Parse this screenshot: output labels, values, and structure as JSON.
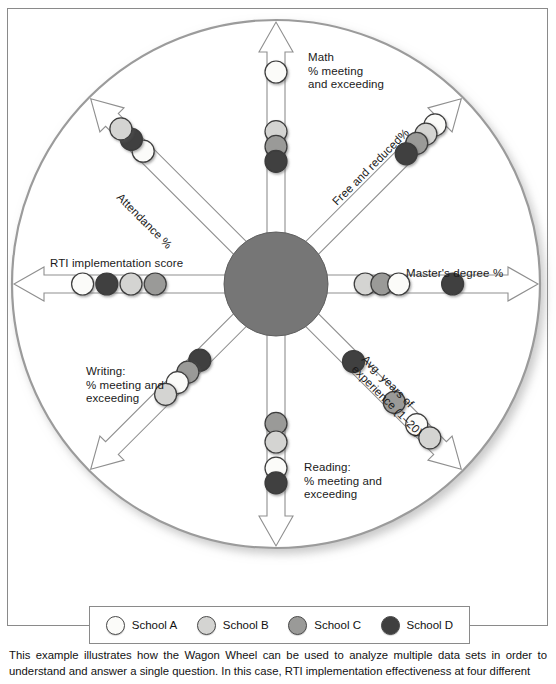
{
  "figure": {
    "name": "Wagon Wheel diagram",
    "caption": "This example illustrates how the Wagon Wheel can be used to analyze multiple data sets in order to understand and answer a single question. In this case, RTI implementation effectiveness at four different"
  },
  "colors": {
    "school_a": "#fbfbf9",
    "school_b": "#d4d4d2",
    "school_c": "#9a9a98",
    "school_d": "#3f3f3f",
    "hub": "#767676",
    "rim": "#9b9b9b",
    "spoke_stroke": "#8f8f8f",
    "frame": "#8a8a8a",
    "text": "#1a1a1a"
  },
  "legend": {
    "name": "school-legend",
    "entries": [
      {
        "label": "School A",
        "color": "#fbfbf9"
      },
      {
        "label": "School B",
        "color": "#d4d4d2"
      },
      {
        "label": "School C",
        "color": "#9a9a98"
      },
      {
        "label": "School D",
        "color": "#3f3f3f"
      }
    ]
  },
  "chart_data": {
    "type": "scatter",
    "title": "Wagon Wheel",
    "subtitle": "",
    "xlabel": "",
    "ylabel": "",
    "legend_position": "bottom",
    "grid": false,
    "series": [
      {
        "name": "School A",
        "color": "#fbfbf9"
      },
      {
        "name": "School B",
        "color": "#d4d4d2"
      },
      {
        "name": "School C",
        "color": "#9a9a98"
      },
      {
        "name": "School D",
        "color": "#3f3f3f"
      }
    ],
    "axes": [
      {
        "id": "math",
        "label": "Math\n% meeting\nand exceeding",
        "label_lines": [
          "Math",
          "% meeting",
          "and exceeding"
        ],
        "angle_deg": 90,
        "label_rotation": 0,
        "axis_range": [
          0,
          100
        ],
        "points": [
          {
            "series": "School A",
            "r": 0.86
          },
          {
            "series": "School B",
            "r": 0.54
          },
          {
            "series": "School C",
            "r": 0.46
          },
          {
            "series": "School D",
            "r": 0.38
          }
        ]
      },
      {
        "id": "free_and_reduced",
        "label": "Free and reduced%",
        "label_lines": [
          "Free and reduced%"
        ],
        "angle_deg": 45,
        "label_rotation": -45,
        "axis_range": [
          0,
          100
        ],
        "points": [
          {
            "series": "School A",
            "r": 0.93
          },
          {
            "series": "School B",
            "r": 0.86
          },
          {
            "series": "School C",
            "r": 0.79
          },
          {
            "series": "School D",
            "r": 0.71
          }
        ]
      },
      {
        "id": "masters_degree",
        "label": "Master's degree %",
        "label_lines": [
          "Master's degree %"
        ],
        "angle_deg": 0,
        "label_rotation": 0,
        "axis_range": [
          0,
          100
        ],
        "points": [
          {
            "series": "School B",
            "r": 0.2
          },
          {
            "series": "School C",
            "r": 0.29
          },
          {
            "series": "School A",
            "r": 0.38
          },
          {
            "series": "School D",
            "r": 0.67
          }
        ]
      },
      {
        "id": "avg_years_experience",
        "label": "Avg. years of\nexperience (1–20)",
        "label_lines": [
          "Avg. years of",
          "experience (1–20)"
        ],
        "angle_deg": -45,
        "label_rotation": 45,
        "axis_range": [
          1,
          20
        ],
        "points": [
          {
            "series": "School D",
            "r": 0.31
          },
          {
            "series": "School C",
            "r": 0.62
          },
          {
            "series": "School A",
            "r": 0.79
          },
          {
            "series": "School B",
            "r": 0.89
          }
        ]
      },
      {
        "id": "reading",
        "label": "Reading:\n% meeting and\nexceeding",
        "label_lines": [
          "Reading:",
          "% meeting and",
          "exceeding"
        ],
        "angle_deg": -90,
        "label_rotation": 0,
        "axis_range": [
          0,
          100
        ],
        "points": [
          {
            "series": "School C",
            "r": 0.47
          },
          {
            "series": "School B",
            "r": 0.57
          },
          {
            "series": "School A",
            "r": 0.71
          },
          {
            "series": "School D",
            "r": 0.79
          }
        ]
      },
      {
        "id": "writing",
        "label": "Writing:\n% meeting and\nexceeding",
        "label_lines": [
          "Writing:",
          "% meeting and",
          "exceeding"
        ],
        "angle_deg": -135,
        "label_rotation": -45,
        "axis_range": [
          0,
          100
        ],
        "points": [
          {
            "series": "School D",
            "r": 0.3
          },
          {
            "series": "School C",
            "r": 0.39
          },
          {
            "series": "School A",
            "r": 0.47
          },
          {
            "series": "School B",
            "r": 0.56
          }
        ]
      },
      {
        "id": "rti_implementation_score",
        "label": "RTI implementation score",
        "label_lines": [
          "RTI implementation score"
        ],
        "angle_deg": 180,
        "label_rotation": 0,
        "axis_range": [
          0,
          100
        ],
        "points": [
          {
            "series": "School C",
            "r": 0.37
          },
          {
            "series": "School B",
            "r": 0.5
          },
          {
            "series": "School D",
            "r": 0.63
          },
          {
            "series": "School A",
            "r": 0.76
          }
        ]
      },
      {
        "id": "attendance",
        "label": "Attendance %",
        "label_lines": [
          "Attendance %"
        ],
        "angle_deg": 135,
        "label_rotation": 45,
        "axis_range": [
          0,
          100
        ],
        "points": [
          {
            "series": "School A",
            "r": 0.73
          },
          {
            "series": "School D",
            "r": 0.82
          },
          {
            "series": "School B",
            "r": 0.9
          }
        ]
      }
    ]
  }
}
